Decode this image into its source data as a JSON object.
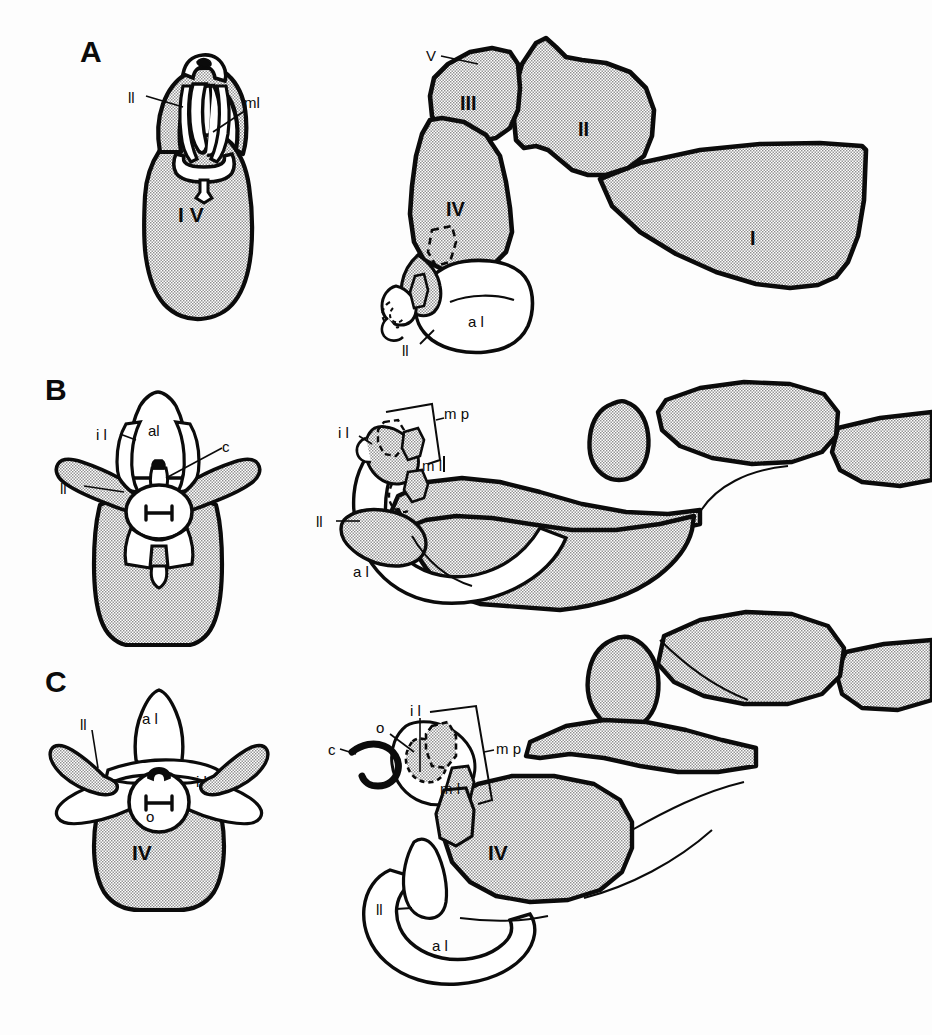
{
  "figure": {
    "kind": "anatomical-line-drawing-plate",
    "background_color": "#fdfdfd",
    "ink_color": "#0b0b0b",
    "stipple_fill_color": "#c9c9c9",
    "white_fill_color": "#ffffff",
    "width": 932,
    "height": 1035
  },
  "panels": [
    {
      "id": "A",
      "letter": "A",
      "views": [
        "dorsal",
        "lateral"
      ],
      "left_view_labels": [
        {
          "text": "ll",
          "x": 128,
          "y": 98
        },
        {
          "text": "ml",
          "x": 248,
          "y": 105
        },
        {
          "text": "I V",
          "x": 193,
          "y": 213
        }
      ],
      "right_view_labels": [
        {
          "text": "V",
          "x": 432,
          "y": 60
        },
        {
          "text": "III",
          "x": 472,
          "y": 100
        },
        {
          "text": "II",
          "x": 592,
          "y": 128
        },
        {
          "text": "I",
          "x": 757,
          "y": 237
        },
        {
          "text": "IV",
          "x": 460,
          "y": 207
        },
        {
          "text": "a l",
          "x": 472,
          "y": 322
        },
        {
          "text": "ll",
          "x": 408,
          "y": 350
        }
      ]
    },
    {
      "id": "B",
      "letter": "B",
      "views": [
        "dorsal",
        "lateral"
      ],
      "left_view_labels": [
        {
          "text": "i l",
          "x": 101,
          "y": 437
        },
        {
          "text": "al",
          "x": 155,
          "y": 429
        },
        {
          "text": "c",
          "x": 225,
          "y": 447
        },
        {
          "text": "ll",
          "x": 64,
          "y": 488
        }
      ],
      "right_view_labels": [
        {
          "text": "i l",
          "x": 345,
          "y": 434
        },
        {
          "text": "m p",
          "x": 445,
          "y": 414
        },
        {
          "text": "m l",
          "x": 433,
          "y": 466
        },
        {
          "text": "ll",
          "x": 321,
          "y": 523
        },
        {
          "text": "a l",
          "x": 358,
          "y": 572
        }
      ]
    },
    {
      "id": "C",
      "letter": "C",
      "views": [
        "dorsal",
        "lateral"
      ],
      "left_view_labels": [
        {
          "text": "ll",
          "x": 85,
          "y": 726
        },
        {
          "text": "a l",
          "x": 148,
          "y": 718
        },
        {
          "text": "i l",
          "x": 100,
          "y": 784
        },
        {
          "text": "i l",
          "x": 200,
          "y": 781
        },
        {
          "text": "o",
          "x": 150,
          "y": 805
        },
        {
          "text": "IV",
          "x": 146,
          "y": 849
        }
      ],
      "right_view_labels": [
        {
          "text": "i l",
          "x": 414,
          "y": 712
        },
        {
          "text": "o",
          "x": 381,
          "y": 729
        },
        {
          "text": "c",
          "x": 332,
          "y": 749
        },
        {
          "text": "m p",
          "x": 495,
          "y": 748
        },
        {
          "text": "m l",
          "x": 448,
          "y": 789
        },
        {
          "text": "ll",
          "x": 382,
          "y": 912
        },
        {
          "text": "IV",
          "x": 500,
          "y": 851
        },
        {
          "text": "a l",
          "x": 444,
          "y": 945
        }
      ]
    }
  ],
  "abbreviation_legend": {
    "al": "anterior lobe",
    "c": "cercus",
    "il": "inner lobe",
    "ll": "lateral lobe",
    "ml": "median lobe",
    "mp": "mouthparts",
    "o": "ocellus",
    "I": "segment I",
    "II": "segment II",
    "III": "segment III",
    "IV": "segment IV",
    "V": "segment V"
  }
}
